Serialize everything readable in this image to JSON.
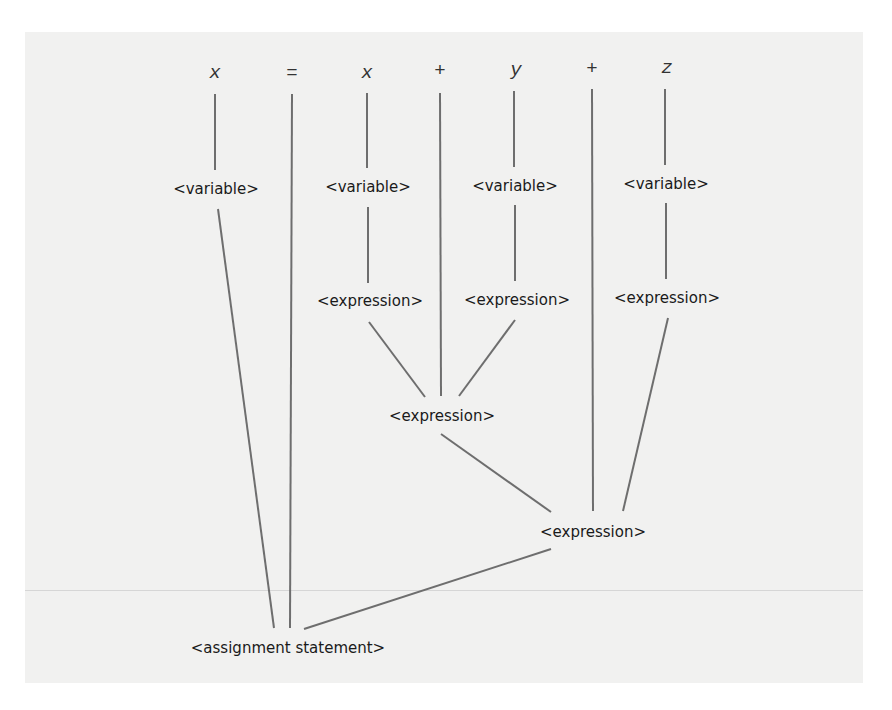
{
  "diagram": {
    "type": "parse-tree",
    "colors": {
      "background": "#f1f1f0",
      "edge": "#6e6e6e",
      "text": "#1a1a1a"
    },
    "terminals": [
      {
        "id": "t_x1",
        "label": "x",
        "italic": true
      },
      {
        "id": "t_eq",
        "label": "=",
        "italic": false
      },
      {
        "id": "t_x2",
        "label": "x",
        "italic": true
      },
      {
        "id": "t_plus1",
        "label": "+",
        "italic": false
      },
      {
        "id": "t_y",
        "label": "y",
        "italic": true
      },
      {
        "id": "t_plus2",
        "label": "+",
        "italic": false
      },
      {
        "id": "t_z",
        "label": "z",
        "italic": true
      }
    ],
    "nodes": {
      "var1": "<variable>",
      "var2": "<variable>",
      "var3": "<variable>",
      "var4": "<variable>",
      "expr_x": "<expression>",
      "expr_y": "<expression>",
      "expr_z": "<expression>",
      "expr_xy": "<expression>",
      "expr_xyz": "<expression>",
      "root": "<assignment statement>"
    },
    "edges": [
      [
        "t_x1",
        "var1"
      ],
      [
        "t_x2",
        "var2"
      ],
      [
        "t_y",
        "var3"
      ],
      [
        "t_z",
        "var4"
      ],
      [
        "var2",
        "expr_x"
      ],
      [
        "var3",
        "expr_y"
      ],
      [
        "var4",
        "expr_z"
      ],
      [
        "expr_x",
        "expr_xy"
      ],
      [
        "t_plus1",
        "expr_xy"
      ],
      [
        "expr_y",
        "expr_xy"
      ],
      [
        "expr_xy",
        "expr_xyz"
      ],
      [
        "t_plus2",
        "expr_xyz"
      ],
      [
        "expr_z",
        "expr_xyz"
      ],
      [
        "var1",
        "root"
      ],
      [
        "t_eq",
        "root"
      ],
      [
        "expr_xyz",
        "root"
      ]
    ]
  }
}
